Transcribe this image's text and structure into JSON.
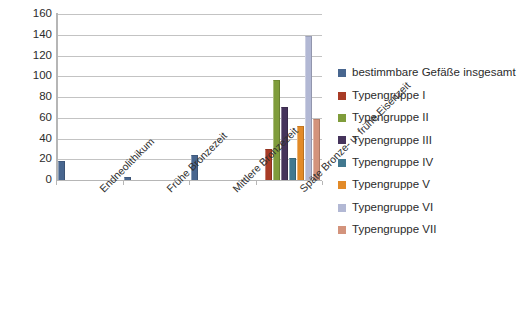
{
  "chart_data": {
    "type": "bar",
    "title": "",
    "xlabel": "",
    "ylabel": "",
    "ylim": [
      0,
      160
    ],
    "ytick_step": 20,
    "yticks": [
      160,
      140,
      120,
      100,
      80,
      60,
      40,
      20,
      0
    ],
    "grid": true,
    "legend_position": "right",
    "categories": [
      "Endneolithikum",
      "Frühe Bronzezeit",
      "Mittlere Bronzezeit",
      "Späte Bronze- u. frühe Eisenzeit"
    ],
    "series": [
      {
        "name": "bestimmbare Gefäße insgesamt",
        "color": "#48668f",
        "values": [
          18,
          3,
          24,
          0
        ]
      },
      {
        "name": "Typengruppe I",
        "color": "#a83c26",
        "values": [
          0,
          0,
          0,
          30
        ]
      },
      {
        "name": "Typengruppe II",
        "color": "#7f9c3b",
        "values": [
          0,
          0,
          0,
          96
        ]
      },
      {
        "name": "Typengruppe III",
        "color": "#45335b",
        "values": [
          0,
          0,
          0,
          70
        ]
      },
      {
        "name": "Typengruppe IV",
        "color": "#41788f",
        "values": [
          0,
          0,
          0,
          21
        ]
      },
      {
        "name": "Typengruppe V",
        "color": "#e28a28",
        "values": [
          0,
          0,
          0,
          52
        ]
      },
      {
        "name": "Typengruppe VI",
        "color": "#b2b8d4",
        "values": [
          0,
          0,
          0,
          139
        ]
      },
      {
        "name": "Typengruppe VII",
        "color": "#d3937c",
        "values": [
          0,
          0,
          0,
          59
        ]
      }
    ]
  }
}
